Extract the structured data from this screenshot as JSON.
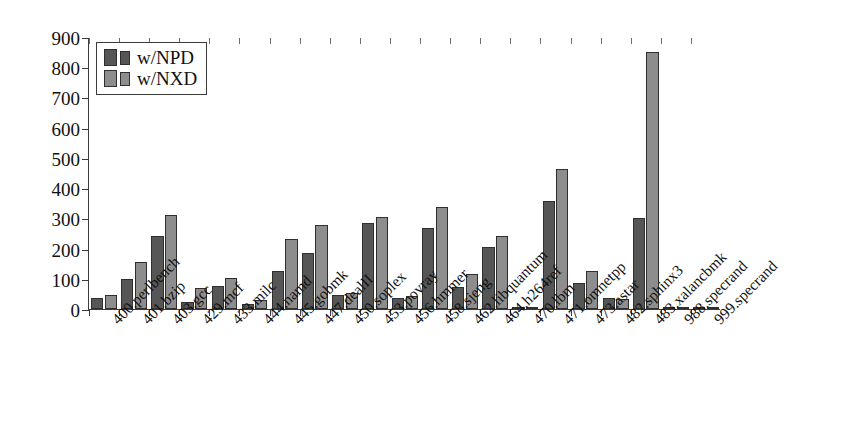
{
  "chart_data": {
    "type": "bar",
    "title": "",
    "subtitle": "",
    "xlabel": "",
    "ylabel": "",
    "ylim": [
      0,
      900
    ],
    "yticks": [
      0,
      100,
      200,
      300,
      400,
      500,
      600,
      700,
      800,
      900
    ],
    "ytick_labels": [
      "0",
      "100",
      "200",
      "300",
      "400",
      "500",
      "600",
      "700",
      "800",
      "900"
    ],
    "grid": false,
    "legend_position": "upper-left",
    "categories": [
      "400.perlbench",
      "401.bzip",
      "403.gcc",
      "429.mcf",
      "433.milc",
      "444.namd",
      "445.gobmk",
      "447.dealII",
      "450.soplex",
      "453.povray",
      "456.hmmer",
      "458.sjeng",
      "462.libquantum",
      "464.h264ref",
      "470.lbm",
      "471.omnetpp",
      "473.astar",
      "482.sphinx3",
      "483.xalancbmk",
      "988.specrand",
      "999.specrand"
    ],
    "series": [
      {
        "name": "w/NPD",
        "color": "#565656",
        "values": [
          35,
          100,
          240,
          22,
          75,
          18,
          125,
          185,
          45,
          285,
          35,
          268,
          72,
          205,
          2,
          358,
          85,
          38,
          300,
          2,
          2
        ]
      },
      {
        "name": "w/NXD",
        "color": "#8d8d8d",
        "values": [
          45,
          155,
          312,
          70,
          102,
          30,
          232,
          278,
          52,
          305,
          42,
          338,
          115,
          240,
          2,
          462,
          125,
          32,
          850,
          2,
          2
        ]
      }
    ]
  },
  "legend": {
    "entries": [
      {
        "label": "w/NPD",
        "color": "#565656"
      },
      {
        "label": "w/NXD",
        "color": "#8d8d8d"
      }
    ]
  },
  "axes": {
    "frame_color": "#3b3b3b",
    "tick_color": "#3b3b3b"
  }
}
